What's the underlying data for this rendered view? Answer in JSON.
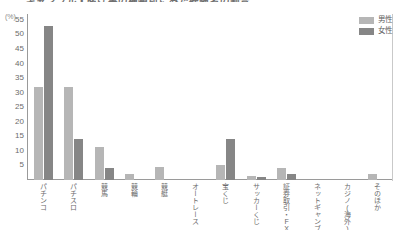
{
  "chart_data": {
    "type": "bar",
    "title": "ギャンブル・賭け事の種類別にみた経験者の割合",
    "unit_label": "(%)",
    "xlabel": "",
    "ylabel": "",
    "ylim": [
      0,
      57
    ],
    "yticks": [
      55,
      50,
      45,
      40,
      35,
      30,
      25,
      20,
      15,
      10,
      5
    ],
    "grid": true,
    "legend_position": "top-right",
    "categories": [
      "パチンコ",
      "パチスロ",
      "競馬",
      "競輪",
      "競艇",
      "オートレース",
      "宝くじ",
      "サッカーくじ",
      "証券取引・FX",
      "ネットギャンブル",
      "カジノ(海外)",
      "そのほか"
    ],
    "series": [
      {
        "name": "男性",
        "color": "#b6b6b6",
        "values": [
          32,
          32,
          11.5,
          2,
          4.5,
          0,
          5,
          1.5,
          4,
          0,
          0,
          2
        ]
      },
      {
        "name": "女性",
        "color": "#868686",
        "values": [
          53,
          14,
          4,
          0,
          0,
          0,
          14,
          1,
          2,
          0,
          0,
          0
        ]
      }
    ]
  }
}
